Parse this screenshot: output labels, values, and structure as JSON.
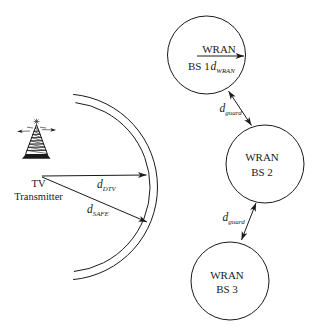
{
  "figure": {
    "background": "#ffffff",
    "ink": "#1a1a1a",
    "transmitter": {
      "line1": "TV",
      "line2": "Transmitter"
    },
    "coverage": {
      "d_dtv": {
        "base": "d",
        "sub": "DTV"
      },
      "d_safe": {
        "base": "d",
        "sub": "SAFE"
      }
    },
    "wran": {
      "bs1": {
        "network": "WRAN",
        "id": "BS 1",
        "radius_label": {
          "base": "d",
          "sub": "WRAN"
        }
      },
      "bs2": {
        "network": "WRAN",
        "id": "BS 2"
      },
      "bs3": {
        "network": "WRAN",
        "id": "BS 3"
      },
      "guard_top": {
        "base": "d",
        "sub": "guard"
      },
      "guard_bottom": {
        "base": "d",
        "sub": "guard"
      }
    }
  }
}
